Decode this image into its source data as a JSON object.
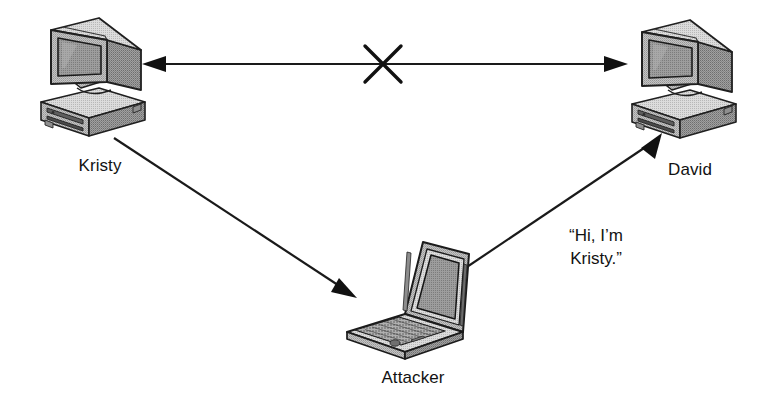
{
  "diagram": {
    "background_color": "#ffffff",
    "line_color": "#1a1a1a",
    "device_fill_light": "#d8d8d8",
    "device_fill_mid": "#b4b4b4",
    "device_fill_dark": "#8c8c8c",
    "screen_fill": "#9a9a9a",
    "nodes": [
      {
        "id": "kristy",
        "label": "Kristy",
        "icon": "desktop-computer-icon",
        "device_type": "CRT desktop computer",
        "x": 100,
        "y": 80
      },
      {
        "id": "david",
        "label": "David",
        "icon": "desktop-computer-icon",
        "device_type": "CRT desktop computer",
        "x": 682,
        "y": 83
      },
      {
        "id": "attacker",
        "label": "Attacker",
        "icon": "laptop-computer-icon",
        "device_type": "Laptop computer",
        "x": 410,
        "y": 297
      }
    ],
    "connections": [
      {
        "id": "kristy-david",
        "from": "kristy",
        "to": "david",
        "style": "double-arrow",
        "blocked": true,
        "blocked_marker": "x-mark",
        "label": ""
      },
      {
        "id": "kristy-attacker",
        "from": "kristy",
        "to": "attacker",
        "style": "single-arrow",
        "blocked": false,
        "label": ""
      },
      {
        "id": "attacker-david",
        "from": "attacker",
        "to": "david",
        "style": "single-arrow",
        "blocked": false,
        "label": "message"
      }
    ],
    "message": {
      "text": "“Hi, I’m\nKristy.”",
      "line1": "“Hi, I’m",
      "line2": "Kristy.”"
    }
  }
}
